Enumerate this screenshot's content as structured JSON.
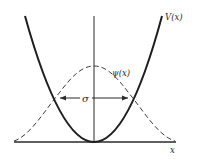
{
  "diagram": {
    "type": "physics-figure",
    "labels": {
      "potential": "V(x)",
      "wavefunction": "ψ(x)",
      "width": "σ",
      "x_axis": "x"
    },
    "curves": [
      {
        "name": "V(x)",
        "style": "solid-thick",
        "shape": "parabola"
      },
      {
        "name": "ψ(x)",
        "style": "dashed",
        "shape": "gaussian"
      }
    ],
    "annotation": {
      "type": "double-arrow",
      "label": "σ"
    },
    "colors": {
      "ink": "#2a2a2a",
      "background": "#ffffff"
    }
  }
}
